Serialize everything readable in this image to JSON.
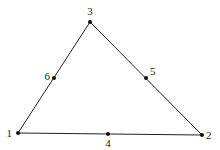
{
  "diagram": {
    "type": "quadratic-triangle-element",
    "line_color": "#222222",
    "node_color": "#111111",
    "nodes": [
      {
        "id": "1",
        "label": "1",
        "x": 18,
        "y": 133,
        "lx": 12,
        "ly": 137,
        "anchor": "end"
      },
      {
        "id": "2",
        "label": "2",
        "x": 202,
        "y": 135,
        "lx": 206,
        "ly": 139,
        "anchor": "start"
      },
      {
        "id": "3",
        "label": "3",
        "x": 90,
        "y": 22,
        "lx": 90,
        "ly": 15,
        "anchor": "middle"
      },
      {
        "id": "4",
        "label": "4",
        "x": 108,
        "y": 134,
        "lx": 108,
        "ly": 147,
        "anchor": "middle"
      },
      {
        "id": "5",
        "label": "5",
        "x": 146,
        "y": 78,
        "lx": 150,
        "ly": 75,
        "anchor": "start"
      },
      {
        "id": "6",
        "label": "6",
        "x": 54,
        "y": 78,
        "lx": 50,
        "ly": 80,
        "anchor": "end"
      }
    ],
    "edges": [
      {
        "from": "1",
        "to": "2"
      },
      {
        "from": "2",
        "to": "3"
      },
      {
        "from": "3",
        "to": "1"
      }
    ]
  }
}
